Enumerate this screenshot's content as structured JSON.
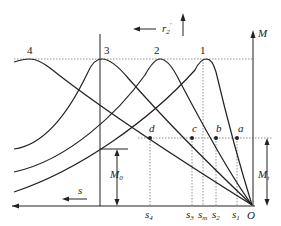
{
  "diagram": {
    "curve_labels": [
      "4",
      "3",
      "2",
      "1"
    ],
    "point_labels": {
      "a": "a",
      "b": "b",
      "c": "c",
      "d": "d"
    },
    "slip_labels": {
      "s4": "s",
      "s4_sub": "4",
      "s3": "s",
      "s3_sub": "3",
      "sm": "s",
      "sm_sub": "m",
      "s2": "s",
      "s2_sub": "2",
      "s1": "s",
      "s1_sub": "1"
    },
    "axis_labels": {
      "M": "M",
      "O": "O",
      "s": "s",
      "r2": "r",
      "r2_sub": "2",
      "r2_prime": "′",
      "M0": "M",
      "M0_sub": "0",
      "Mt": "M",
      "Mt_sub": "t"
    },
    "colors": {
      "line": "#222222",
      "dotted": "#777777",
      "background": "#ffffff"
    }
  }
}
